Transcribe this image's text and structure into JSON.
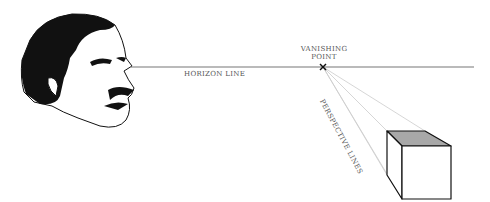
{
  "diagram": {
    "labels": {
      "vanishing_point_line1": "VANISHING",
      "vanishing_point_line2": "POINT",
      "horizon_line": "HORIZON LINE",
      "perspective_lines": "PERSPECTIVE LINES"
    },
    "colors": {
      "horizon": "#777777",
      "perspective": "#cccccc",
      "cube_top": "#a8a8a8",
      "outline": "#111111"
    },
    "elements": [
      "face-illustration",
      "horizon-line",
      "vanishing-point-x",
      "perspective-lines",
      "cube"
    ]
  }
}
